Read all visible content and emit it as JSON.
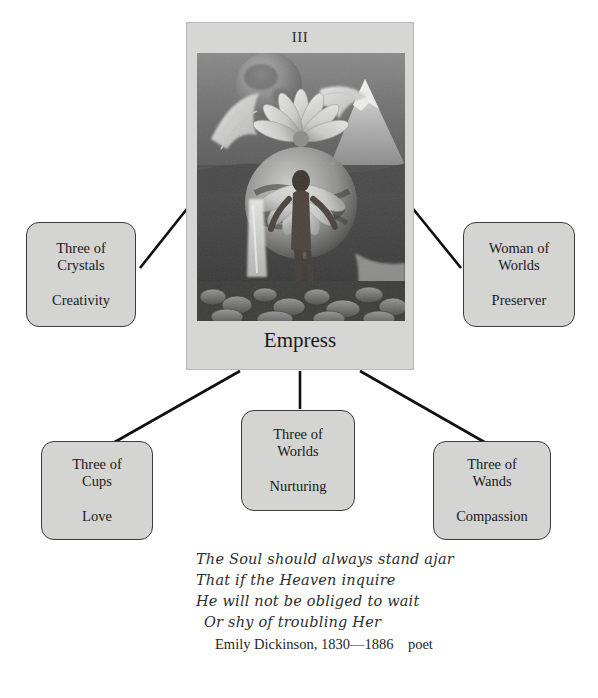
{
  "card": {
    "numeral": "III",
    "title": "Empress",
    "art_name": "empress-collage-photo",
    "art_description": "grayscale photo collage: moon, wings, flower petals, mountain, waterfall, stream and stones",
    "background_color": "#d6d6d4"
  },
  "boxes": [
    {
      "id": "box-crystals",
      "name": "three-of-crystals",
      "title": "Three of\nCrystals",
      "subtitle": "Creativity"
    },
    {
      "id": "box-worlds-w",
      "name": "woman-of-worlds",
      "title": "Woman of\nWorlds",
      "subtitle": "Preserver"
    },
    {
      "id": "box-cups",
      "name": "three-of-cups",
      "title": "Three of\nCups",
      "subtitle": "Love"
    },
    {
      "id": "box-worlds-3",
      "name": "three-of-worlds",
      "title": "Three of\nWorlds",
      "subtitle": "Nurturing"
    },
    {
      "id": "box-wands",
      "name": "three-of-wands",
      "title": "Three of\nWands",
      "subtitle": "Compassion"
    }
  ],
  "connectors": [
    {
      "name": "connector-card-to-crystals",
      "x1": 190,
      "y1": 205,
      "x2": 140,
      "y2": 268
    },
    {
      "name": "connector-card-to-woman-of-worlds",
      "x1": 410,
      "y1": 205,
      "x2": 461,
      "y2": 268
    },
    {
      "name": "connector-card-to-cups",
      "x1": 240,
      "y1": 371,
      "x2": 113,
      "y2": 443
    },
    {
      "name": "connector-card-to-three-of-worlds",
      "x1": 300,
      "y1": 371,
      "x2": 300,
      "y2": 409
    },
    {
      "name": "connector-card-to-wands",
      "x1": 360,
      "y1": 371,
      "x2": 486,
      "y2": 443
    }
  ],
  "poem": {
    "lines": [
      "The Soul should always stand ajar",
      "That if the Heaven inquire",
      "He will not be obliged to wait",
      "Or shy of troubling Her"
    ],
    "attribution": "Emily Dickinson, 1830—1886    poet"
  },
  "colors": {
    "page_background": "#ffffff",
    "box_fill": "#d4d4d2",
    "box_border": "#3a3a3a",
    "line": "#101010",
    "text": "#1a1a1a"
  }
}
